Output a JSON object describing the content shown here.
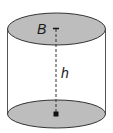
{
  "diagram": {
    "labels": {
      "base_area": "B",
      "height": "h"
    },
    "colors": {
      "base_fill": "#bdbdbd",
      "stroke": "#333333",
      "background": "#ffffff"
    }
  }
}
